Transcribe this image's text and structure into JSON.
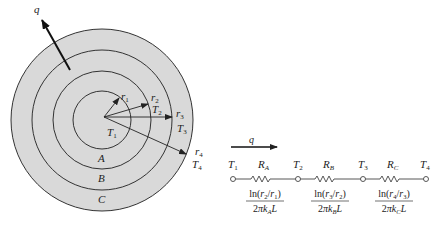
{
  "figure": {
    "cylinder": {
      "heat_flow_label": "q",
      "radii": [
        {
          "sym": "r",
          "sub": "1"
        },
        {
          "sym": "r",
          "sub": "2"
        },
        {
          "sym": "r",
          "sub": "3"
        },
        {
          "sym": "r",
          "sub": "4"
        }
      ],
      "temperatures": [
        {
          "sym": "T",
          "sub": "1"
        },
        {
          "sym": "T",
          "sub": "2"
        },
        {
          "sym": "T",
          "sub": "3"
        },
        {
          "sym": "T",
          "sub": "4"
        }
      ],
      "layers": [
        "A",
        "B",
        "C"
      ],
      "colors": {
        "fill": "#d9d9d9",
        "stroke": "#222222"
      }
    },
    "circuit": {
      "heat_flow_label": "q",
      "nodes": [
        {
          "sym": "T",
          "sub": "1"
        },
        {
          "sym": "T",
          "sub": "2"
        },
        {
          "sym": "T",
          "sub": "3"
        },
        {
          "sym": "T",
          "sub": "4"
        }
      ],
      "resistors": [
        {
          "sym": "R",
          "sub": "A",
          "num_pre": "ln(",
          "num_r_a": "r",
          "num_a": "2",
          "num_mid": "/",
          "num_r_b": "r",
          "num_b": "1",
          "num_post": ")",
          "den_pre": "2",
          "den_pi": "π",
          "den_k": "k",
          "den_sub": "A",
          "den_L": "L"
        },
        {
          "sym": "R",
          "sub": "B",
          "num_pre": "ln(",
          "num_r_a": "r",
          "num_a": "3",
          "num_mid": "/",
          "num_r_b": "r",
          "num_b": "2",
          "num_post": ")",
          "den_pre": "2",
          "den_pi": "π",
          "den_k": "k",
          "den_sub": "B",
          "den_L": "L"
        },
        {
          "sym": "R",
          "sub": "C",
          "num_pre": "ln(",
          "num_r_a": "r",
          "num_a": "4",
          "num_mid": "/",
          "num_r_b": "r",
          "num_b": "3",
          "num_post": ")",
          "den_pre": "2",
          "den_pi": "π",
          "den_k": "k",
          "den_sub": "C",
          "den_L": "L"
        }
      ]
    }
  }
}
